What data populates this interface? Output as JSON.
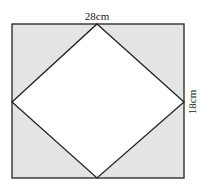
{
  "diagram": {
    "type": "rectangle with inscribed rhombus",
    "labels": {
      "top": "28cm",
      "right": "18cm"
    },
    "colors": {
      "shaded": "#e4e4e4",
      "inner": "#ffffff",
      "stroke": "#222222"
    }
  }
}
